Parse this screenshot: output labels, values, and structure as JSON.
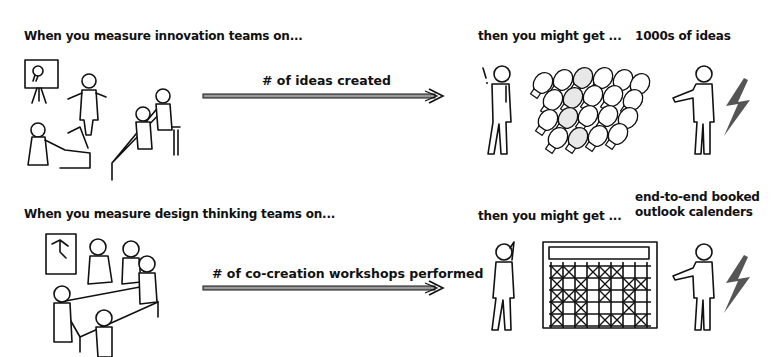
{
  "rows": [
    {
      "lead_text": "When you measure  innovation teams on...",
      "metric_text": "# of ideas created",
      "result_intro": "then you might get ...",
      "result_text": "1000s of ideas",
      "left_illustration": "team-meeting-with-idea-board",
      "center_illustration": "pile-of-lightbulbs"
    },
    {
      "lead_text": "When you measure design thinking teams on...",
      "metric_text": "# of co-creation workshops performed",
      "result_intro": "then you might get ...",
      "result_text_line1": "end-to-end booked",
      "result_text_line2": "outlook calenders",
      "left_illustration": "team-workshop-around-table",
      "center_illustration": "fully-booked-calendar"
    }
  ],
  "colors": {
    "ink": "#111111",
    "arrow_fill": "#9a9a9a",
    "lightning": "#555555",
    "background": "#ffffff"
  }
}
